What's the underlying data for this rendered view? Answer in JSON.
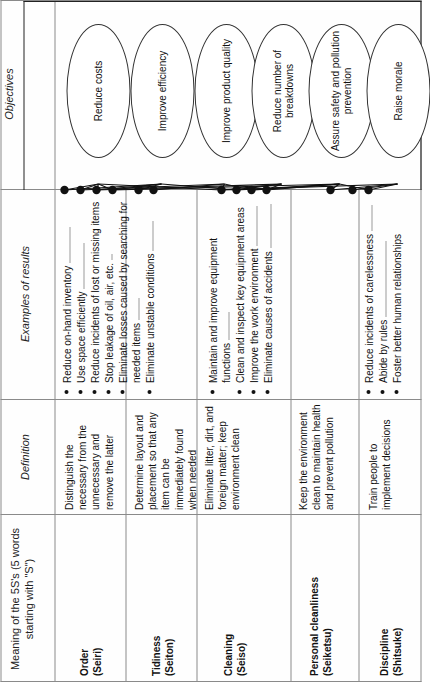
{
  "diagram": {
    "columns": [
      {
        "id": "meaning",
        "label": "Meaning of the 5S's (5 words starting with \"S\")",
        "italic": false
      },
      {
        "id": "definition",
        "label": "Definition",
        "italic": true
      },
      {
        "id": "examples",
        "label": "Examples of results",
        "italic": true
      },
      {
        "id": "objectives",
        "label": "Objectives",
        "italic": true
      }
    ],
    "rows": [
      {
        "name": "Order",
        "japanese": "(Seiri)",
        "definition": "Distinguish the necessary from the unnecessary and remove the latter",
        "results": [
          "Reduce on-hand inventory",
          "Use space efficiently",
          "Reduce incidents of lost or missing items",
          "Stop leakage of oil, air, etc.",
          "Eliminate losses caused by searching for needed items",
          "Eliminate unstable conditions"
        ]
      },
      {
        "name": "Tidiness",
        "japanese": "(Seiton)",
        "definition": "Determine layout and placement so that any item can be immediately found when needed",
        "results": []
      },
      {
        "name": "Cleaning",
        "japanese": "(Seiso)",
        "definition": "Eliminate litter, dirt, and foreign matter; keep environment clean",
        "results": [
          "Maintain and improve equipment functions",
          "Clean and inspect key equipment areas",
          "Improve the work environment",
          "Eliminate causes of accidents"
        ]
      },
      {
        "name": "Personal cleanliness",
        "japanese": "(Seiketsu)",
        "definition": "Keep the environment clean to maintain health and prevent pollution",
        "results": []
      },
      {
        "name": "Discipline",
        "japanese": "(Shitsuke)",
        "definition": "Train people to implement decisions",
        "results": [
          "Reduce incidents of carelessness",
          "Abide by rules",
          "Foster better human relationships"
        ]
      }
    ],
    "objectives": [
      {
        "id": "o1",
        "label": "Reduce costs"
      },
      {
        "id": "o2",
        "label": "Improve efficiency"
      },
      {
        "id": "o3",
        "label": "Improve product quality"
      },
      {
        "id": "o4",
        "label": "Reduce number of breakdowns"
      },
      {
        "id": "o5",
        "label": "Assure safety and pollution prevention"
      },
      {
        "id": "o6",
        "label": "Raise morale"
      }
    ],
    "colors": {
      "ink": "#111111",
      "rule": "#8a8a8a",
      "frame": "#222222",
      "paper": "#fefefe"
    }
  }
}
